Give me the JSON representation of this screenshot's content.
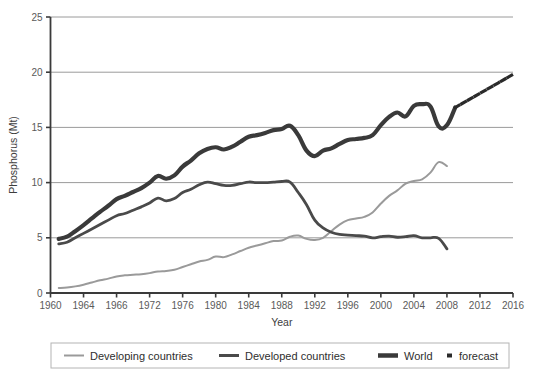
{
  "chart_data": {
    "type": "line",
    "title": "",
    "xlabel": "Year",
    "ylabel": "Phosphorus (Mt)",
    "xlim": [
      1960,
      2016
    ],
    "ylim": [
      0,
      25
    ],
    "yticks": [
      0,
      5,
      10,
      15,
      20,
      25
    ],
    "ytick_labels": [
      "0",
      "5",
      "10",
      "15",
      "20",
      "25"
    ],
    "xticks": [
      1960,
      1964,
      1968,
      1972,
      1976,
      1980,
      1984,
      1988,
      1992,
      1996,
      2000,
      2004,
      2008,
      2012,
      2016
    ],
    "xtick_labels": [
      "1960",
      "1964",
      "1966",
      "1972",
      "1976",
      "1980",
      "1984",
      "1988",
      "1992",
      "1996",
      "2000",
      "2004",
      "2008",
      "2012",
      "2016"
    ],
    "grid": "horizontal",
    "legend_position": "bottom",
    "series": [
      {
        "name": "Developing countries",
        "color": "#9a9a9a",
        "width": 2.0,
        "style": "solid",
        "x": [
          1961,
          1962,
          1963,
          1964,
          1965,
          1966,
          1967,
          1968,
          1969,
          1970,
          1971,
          1972,
          1973,
          1974,
          1975,
          1976,
          1977,
          1978,
          1979,
          1980,
          1981,
          1982,
          1983,
          1984,
          1985,
          1986,
          1987,
          1988,
          1989,
          1990,
          1991,
          1992,
          1993,
          1994,
          1995,
          1996,
          1997,
          1998,
          1999,
          2000,
          2001,
          2002,
          2003,
          2004,
          2005,
          2006,
          2007,
          2008
        ],
        "values": [
          0.45,
          0.5,
          0.6,
          0.75,
          0.95,
          1.15,
          1.3,
          1.5,
          1.6,
          1.65,
          1.7,
          1.8,
          1.95,
          2.0,
          2.1,
          2.35,
          2.6,
          2.85,
          3.0,
          3.3,
          3.25,
          3.5,
          3.8,
          4.1,
          4.3,
          4.5,
          4.7,
          4.75,
          5.1,
          5.2,
          4.9,
          4.8,
          5.0,
          5.6,
          6.2,
          6.6,
          6.75,
          6.9,
          7.3,
          8.1,
          8.8,
          9.3,
          9.9,
          10.15,
          10.3,
          10.9,
          11.85,
          11.5
        ]
      },
      {
        "name": "Developed countries",
        "color": "#4a4a4a",
        "width": 2.8,
        "style": "solid",
        "x": [
          1961,
          1962,
          1963,
          1964,
          1965,
          1966,
          1967,
          1968,
          1969,
          1970,
          1971,
          1972,
          1973,
          1974,
          1975,
          1976,
          1977,
          1978,
          1979,
          1980,
          1981,
          1982,
          1983,
          1984,
          1985,
          1986,
          1987,
          1988,
          1989,
          1990,
          1991,
          1992,
          1993,
          1994,
          1995,
          1996,
          1997,
          1998,
          1999,
          2000,
          2001,
          2002,
          2003,
          2004,
          2005,
          2006,
          2007,
          2008
        ],
        "values": [
          4.45,
          4.6,
          5.0,
          5.4,
          5.8,
          6.2,
          6.6,
          7.0,
          7.2,
          7.5,
          7.8,
          8.15,
          8.6,
          8.35,
          8.55,
          9.1,
          9.4,
          9.8,
          10.05,
          9.9,
          9.75,
          9.75,
          9.9,
          10.05,
          10.0,
          10.0,
          10.05,
          10.1,
          10.05,
          9.1,
          8.0,
          6.6,
          5.9,
          5.5,
          5.3,
          5.25,
          5.2,
          5.15,
          5.0,
          5.1,
          5.15,
          5.05,
          5.1,
          5.2,
          5.0,
          5.0,
          4.95,
          4.0
        ]
      },
      {
        "name": "World",
        "color": "#3a3a3a",
        "width": 4.2,
        "style": "solid",
        "x": [
          1961,
          1962,
          1963,
          1964,
          1965,
          1966,
          1967,
          1968,
          1969,
          1970,
          1971,
          1972,
          1973,
          1974,
          1975,
          1976,
          1977,
          1978,
          1979,
          1980,
          1981,
          1982,
          1983,
          1984,
          1985,
          1986,
          1987,
          1988,
          1989,
          1990,
          1991,
          1992,
          1993,
          1994,
          1995,
          1996,
          1997,
          1998,
          1999,
          2000,
          2001,
          2002,
          2003,
          2004,
          2005,
          2006,
          2007,
          2008,
          2009
        ],
        "values": [
          4.9,
          5.1,
          5.6,
          6.15,
          6.75,
          7.35,
          7.9,
          8.5,
          8.8,
          9.15,
          9.5,
          10.0,
          10.6,
          10.35,
          10.65,
          11.45,
          12.0,
          12.65,
          13.05,
          13.2,
          13.0,
          13.25,
          13.7,
          14.15,
          14.3,
          14.5,
          14.75,
          14.85,
          15.15,
          14.3,
          12.9,
          12.4,
          12.9,
          13.1,
          13.5,
          13.85,
          13.95,
          14.05,
          14.3,
          15.2,
          15.95,
          16.35,
          16.0,
          16.95,
          17.1,
          16.9,
          15.1,
          15.2,
          16.8
        ]
      },
      {
        "name": "forecast",
        "color": "#2a2a2a",
        "width": 3.2,
        "style": "dotted",
        "x": [
          2009,
          2016
        ],
        "values": [
          16.8,
          19.8
        ]
      }
    ],
    "legend": [
      {
        "label": "Developing countries",
        "color": "#9a9a9a",
        "width": 2.0,
        "style": "solid"
      },
      {
        "label": "Developed countries",
        "color": "#4a4a4a",
        "width": 3.0,
        "style": "solid"
      },
      {
        "label": "World",
        "color": "#3a3a3a",
        "width": 4.5,
        "style": "solid"
      },
      {
        "label": "forecast",
        "color": "#2a2a2a",
        "width": 4.0,
        "style": "dotted"
      }
    ]
  }
}
